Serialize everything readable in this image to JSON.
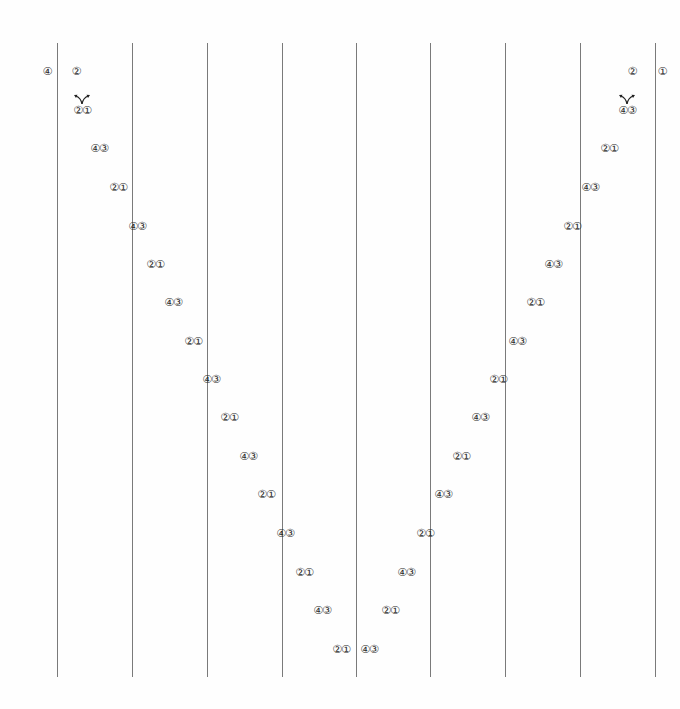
{
  "diagram": {
    "type": "braid-weaving-pattern",
    "vertical_lines_x": [
      57,
      132,
      207,
      282,
      356,
      430,
      505,
      580,
      655
    ],
    "top_labels": [
      {
        "text": "④",
        "x": 47,
        "y": 71
      },
      {
        "text": "②",
        "x": 76,
        "y": 71
      },
      {
        "text": "②",
        "x": 632,
        "y": 71
      },
      {
        "text": "①",
        "x": 662,
        "y": 71
      }
    ],
    "left_diagonal": [
      {
        "text": "②①",
        "x": 82,
        "y": 110
      },
      {
        "text": "④③",
        "x": 99,
        "y": 148
      },
      {
        "text": "②①",
        "x": 118,
        "y": 187
      },
      {
        "text": "④③",
        "x": 137,
        "y": 226
      },
      {
        "text": "②①",
        "x": 155,
        "y": 264
      },
      {
        "text": "④③",
        "x": 173,
        "y": 302
      },
      {
        "text": "②①",
        "x": 193,
        "y": 341
      },
      {
        "text": "④③",
        "x": 211,
        "y": 379
      },
      {
        "text": "②①",
        "x": 229,
        "y": 417
      },
      {
        "text": "④③",
        "x": 248,
        "y": 456
      },
      {
        "text": "②①",
        "x": 266,
        "y": 494
      },
      {
        "text": "④③",
        "x": 285,
        "y": 533
      },
      {
        "text": "②①",
        "x": 304,
        "y": 572
      },
      {
        "text": "④③",
        "x": 322,
        "y": 610
      },
      {
        "text": "②①",
        "x": 341,
        "y": 649
      }
    ],
    "right_diagonal": [
      {
        "text": "④③",
        "x": 369,
        "y": 649
      },
      {
        "text": "②①",
        "x": 390,
        "y": 610
      },
      {
        "text": "④③",
        "x": 406,
        "y": 572
      },
      {
        "text": "②①",
        "x": 425,
        "y": 533
      },
      {
        "text": "④③",
        "x": 443,
        "y": 494
      },
      {
        "text": "②①",
        "x": 461,
        "y": 456
      },
      {
        "text": "④③",
        "x": 480,
        "y": 417
      },
      {
        "text": "②①",
        "x": 498,
        "y": 379
      },
      {
        "text": "④③",
        "x": 517,
        "y": 341
      },
      {
        "text": "②①",
        "x": 535,
        "y": 302
      },
      {
        "text": "④③",
        "x": 553,
        "y": 264
      },
      {
        "text": "②①",
        "x": 572,
        "y": 226
      },
      {
        "text": "④③",
        "x": 590,
        "y": 187
      },
      {
        "text": "②①",
        "x": 609,
        "y": 148
      },
      {
        "text": "④③",
        "x": 627,
        "y": 110
      }
    ],
    "split_arrows": [
      {
        "x": 82,
        "y": 104
      },
      {
        "x": 627,
        "y": 104
      }
    ]
  }
}
